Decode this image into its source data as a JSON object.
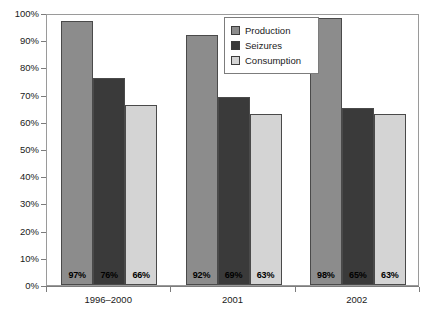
{
  "chart_data": {
    "type": "bar",
    "title": "",
    "xlabel": "",
    "ylabel": "",
    "categories": [
      "1996–2000",
      "2001",
      "2002"
    ],
    "series": [
      {
        "name": "Production",
        "values": [
          97,
          92,
          98
        ],
        "color": "#8c8c8c"
      },
      {
        "name": "Seizures",
        "values": [
          76,
          69,
          65
        ],
        "color": "#3a3a3a"
      },
      {
        "name": "Consumption",
        "values": [
          66,
          63,
          63
        ],
        "color": "#d4d4d4"
      }
    ],
    "value_labels": [
      [
        "97%",
        "76%",
        "66%"
      ],
      [
        "92%",
        "69%",
        "63%"
      ],
      [
        "98%",
        "65%",
        "63%"
      ]
    ],
    "ylim": [
      0,
      100
    ],
    "y_ticks": [
      0,
      10,
      20,
      30,
      40,
      50,
      60,
      70,
      80,
      90,
      100
    ],
    "y_tick_labels": [
      "0%",
      "10%",
      "20%",
      "30%",
      "40%",
      "50%",
      "60%",
      "70%",
      "80%",
      "90%",
      "100%"
    ],
    "grid": false,
    "legend_position": "top-center"
  },
  "legend": {
    "items": [
      {
        "label": "Production"
      },
      {
        "label": "Seizures"
      },
      {
        "label": "Consumption"
      }
    ]
  }
}
